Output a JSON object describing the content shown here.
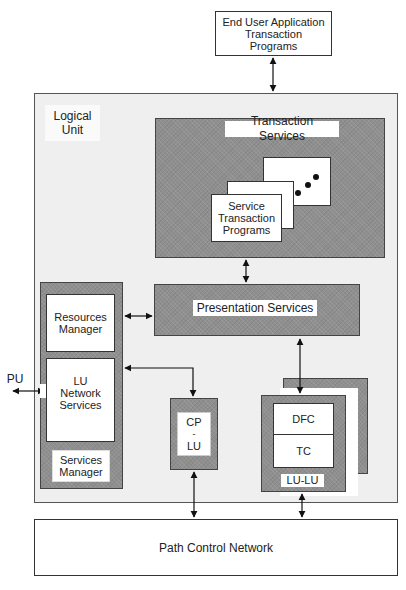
{
  "diagram": {
    "end_user": {
      "label_line1": "End User Application",
      "label_line2": "Transaction",
      "label_line3": "Programs"
    },
    "logical_unit": {
      "label_line1": "Logical",
      "label_line2": "Unit"
    },
    "transaction_services": {
      "label": "Transaction Services",
      "service_tp": {
        "line1": "Service",
        "line2": "Transaction",
        "line3": "Programs"
      }
    },
    "presentation_services": {
      "label": "Presentation Services"
    },
    "left_column": {
      "resources_manager": {
        "line1": "Resources",
        "line2": "Manager"
      },
      "lu_network_services": {
        "line1": "LU",
        "line2": "Network",
        "line3": "Services"
      },
      "services_manager": {
        "line1": "Services",
        "line2": "Manager"
      }
    },
    "pu": {
      "label": "PU"
    },
    "cp_lu": {
      "line1": "CP",
      "line2": "-",
      "line3": "LU"
    },
    "lu_lu": {
      "dfc": "DFC",
      "tc": "TC",
      "label": "LU-LU"
    },
    "path_control": {
      "label": "Path Control Network"
    }
  }
}
